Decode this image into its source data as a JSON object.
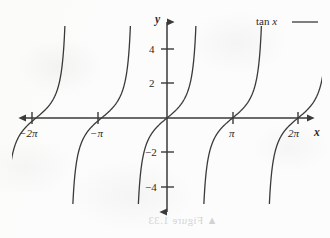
{
  "figure": {
    "background_color": "#fcfcfc",
    "ink_color": "#3a3a3a",
    "text_color": "#2b2b2b"
  },
  "legend": {
    "entry_function": "tan",
    "entry_variable": "x",
    "swatch": "legend-line"
  },
  "axes": {
    "x_axis_label": "x",
    "y_axis_label": "y",
    "x_tick_labels": [
      "−2π",
      "−π",
      "π",
      "2π"
    ],
    "y_tick_labels": [
      "4",
      "2",
      "−2",
      "−4"
    ]
  },
  "watermark": {
    "bleed_through_text": "▲ Figure 1.33"
  },
  "chart_data": {
    "type": "line",
    "title": "",
    "subtitle": "",
    "xlabel": "x",
    "ylabel": "y",
    "legend": [
      "tan x"
    ],
    "legend_position": "top-right",
    "grid": false,
    "xlim": [
      -7.6,
      7.6
    ],
    "ylim": [
      -5.1,
      5.1
    ],
    "xticks": [
      -6.283185,
      -3.141593,
      3.141593,
      6.283185
    ],
    "xticklabels": [
      "−2π",
      "−π",
      "π",
      "2π"
    ],
    "yticks": [
      4,
      2,
      -2,
      -4
    ],
    "yticklabels": [
      "4",
      "2",
      "−2",
      "−4"
    ],
    "series": [
      {
        "name": "tan x",
        "formula": "y = tan(x)",
        "color": "#3a3a3a",
        "asymptotes": [
          -7.853982,
          -4.712389,
          -1.570796,
          1.570796,
          4.712389,
          7.853982
        ],
        "branches": [
          {
            "x_range": [
              -7.853982,
              -4.712389
            ],
            "x_plotted": [
              -7.72,
              -4.84
            ]
          },
          {
            "x_range": [
              -4.712389,
              -1.570796
            ],
            "x_plotted": [
              -4.6,
              -1.7
            ]
          },
          {
            "x_range": [
              -1.570796,
              1.570796
            ],
            "x_plotted": [
              -1.46,
              1.44
            ]
          },
          {
            "x_range": [
              1.570796,
              4.712389
            ],
            "x_plotted": [
              1.7,
              4.58
            ]
          },
          {
            "x_range": [
              4.712389,
              7.853982
            ],
            "x_plotted": [
              4.84,
              7.72
            ]
          }
        ],
        "points": [
          {
            "x": -6.283185,
            "y": 0
          },
          {
            "x": -3.141593,
            "y": 0
          },
          {
            "x": 0,
            "y": 0
          },
          {
            "x": 3.141593,
            "y": 0
          },
          {
            "x": 6.283185,
            "y": 0
          }
        ]
      }
    ]
  }
}
